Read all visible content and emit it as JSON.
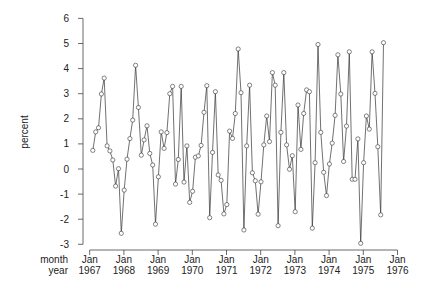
{
  "chart_data": {
    "type": "line",
    "title": "",
    "xlabel_rows": [
      "month",
      "year"
    ],
    "ylabel": "percent",
    "ylim": [
      -3,
      6
    ],
    "yticks": [
      -3,
      -2,
      -1,
      0,
      1,
      2,
      3,
      4,
      5,
      6
    ],
    "xticks": [
      {
        "month": "Jan",
        "year": "1967"
      },
      {
        "month": "Jan",
        "year": "1968"
      },
      {
        "month": "Jan",
        "year": "1969"
      },
      {
        "month": "Jan",
        "year": "1970"
      },
      {
        "month": "Jan",
        "year": "1971"
      },
      {
        "month": "Jan",
        "year": "1972"
      },
      {
        "month": "Jan",
        "year": "1973"
      },
      {
        "month": "Jan",
        "year": "1974"
      },
      {
        "month": "Jan",
        "year": "1975"
      },
      {
        "month": "Jan",
        "year": "1976"
      }
    ],
    "grid": false,
    "marker": "open-circle",
    "series": [
      {
        "name": "percent",
        "values": [
          0.74,
          1.48,
          1.64,
          2.99,
          3.62,
          0.92,
          0.72,
          0.36,
          -0.68,
          0.01,
          -2.56,
          -0.84,
          0.39,
          1.21,
          1.95,
          4.13,
          2.45,
          0.55,
          1.16,
          1.72,
          0.62,
          0.16,
          -2.2,
          -0.31,
          1.48,
          0.82,
          1.45,
          3.0,
          3.29,
          -0.6,
          0.38,
          3.29,
          -0.52,
          0.92,
          -1.33,
          -0.89,
          0.47,
          0.52,
          0.94,
          2.26,
          3.32,
          -1.94,
          0.66,
          3.08,
          -0.24,
          -0.45,
          -1.79,
          -1.42,
          1.51,
          1.22,
          2.21,
          4.78,
          3.04,
          -2.43,
          0.92,
          3.34,
          -0.15,
          -0.47,
          -1.8,
          -0.51,
          0.96,
          2.11,
          1.09,
          3.84,
          3.34,
          -2.26,
          1.46,
          3.84,
          0.96,
          -0.01,
          0.53,
          -1.7,
          2.55,
          0.78,
          2.21,
          3.15,
          3.08,
          -2.36,
          0.25,
          4.96,
          1.46,
          -0.13,
          -1.06,
          0.2,
          1.03,
          2.14,
          4.55,
          2.99,
          0.3,
          1.71,
          4.67,
          -0.41,
          -0.41,
          1.2,
          -2.96,
          0.25,
          2.11,
          1.59,
          4.67,
          3.01,
          0.89,
          -1.83,
          5.03
        ]
      }
    ]
  },
  "axes": {
    "ylabel": "percent",
    "xrow_labels": {
      "month": "month",
      "year": "year"
    }
  }
}
